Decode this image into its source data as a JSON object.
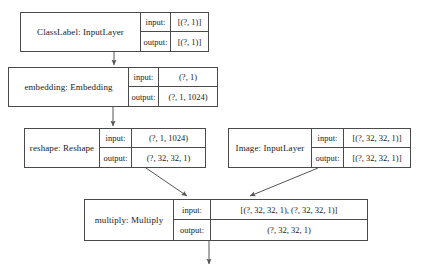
{
  "diagram": {
    "io_labels": {
      "input": "input:",
      "output": "output:"
    },
    "stroke_color": "#4a4a4a",
    "arrow_color": "#555555",
    "background": "#ffffff"
  },
  "nodes": [
    {
      "id": "classlabel",
      "name": "ClassLabel: InputLayer",
      "input": "[(?, 1)]",
      "output": "[(?, 1)]"
    },
    {
      "id": "embedding",
      "name": "embedding: Embedding",
      "input": "(?, 1)",
      "output": "(?, 1, 1024)"
    },
    {
      "id": "reshape",
      "name": "reshape: Reshape",
      "input": "(?, 1, 1024)",
      "output": "(?, 32, 32, 1)"
    },
    {
      "id": "image",
      "name": "Image: InputLayer",
      "input": "[(?, 32, 32, 1)]",
      "output": "[(?, 32, 32, 1)]"
    },
    {
      "id": "multiply",
      "name": "multiply: Multiply",
      "input": "[(?, 32, 32, 1), (?, 32, 32, 1)]",
      "output": "(?, 32, 32, 1)"
    }
  ],
  "edges": [
    {
      "id": "classlabel-to-embedding",
      "from": "classlabel",
      "to": "embedding",
      "kind": "vertical"
    },
    {
      "id": "embedding-to-reshape",
      "from": "embedding",
      "to": "reshape",
      "kind": "vertical"
    },
    {
      "id": "reshape-to-multiply",
      "from": "reshape",
      "to": "multiply",
      "kind": "diagonal"
    },
    {
      "id": "image-to-multiply",
      "from": "image",
      "to": "multiply",
      "kind": "diagonal"
    },
    {
      "id": "multiply-to-output",
      "from": "multiply",
      "to": "",
      "kind": "vertical"
    }
  ]
}
